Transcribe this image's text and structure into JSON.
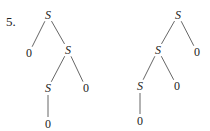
{
  "problem_number": "5.",
  "trees": [
    {
      "name": "left-tree",
      "nodes": [
        {
          "id": "a",
          "label": "S",
          "x": 48,
          "y": 15,
          "italic": true
        },
        {
          "id": "b",
          "label": "0",
          "x": 29,
          "y": 53,
          "italic": false
        },
        {
          "id": "c",
          "label": "S",
          "x": 68,
          "y": 50,
          "italic": true
        },
        {
          "id": "d",
          "label": "S",
          "x": 48,
          "y": 88,
          "italic": true
        },
        {
          "id": "e",
          "label": "0",
          "x": 86,
          "y": 88,
          "italic": false
        },
        {
          "id": "f",
          "label": "0",
          "x": 48,
          "y": 124,
          "italic": false
        }
      ],
      "edges": [
        [
          "a",
          "b"
        ],
        [
          "a",
          "c"
        ],
        [
          "c",
          "d"
        ],
        [
          "c",
          "e"
        ],
        [
          "d",
          "f"
        ]
      ]
    },
    {
      "name": "right-tree",
      "nodes": [
        {
          "id": "a",
          "label": "S",
          "x": 178,
          "y": 15,
          "italic": true
        },
        {
          "id": "b",
          "label": "0",
          "x": 197,
          "y": 52,
          "italic": false
        },
        {
          "id": "c",
          "label": "S",
          "x": 158,
          "y": 50,
          "italic": true
        },
        {
          "id": "d",
          "label": "S",
          "x": 140,
          "y": 86,
          "italic": true
        },
        {
          "id": "e",
          "label": "0",
          "x": 177,
          "y": 86,
          "italic": false
        },
        {
          "id": "f",
          "label": "0",
          "x": 140,
          "y": 121,
          "italic": false
        }
      ],
      "edges": [
        [
          "a",
          "b"
        ],
        [
          "a",
          "c"
        ],
        [
          "c",
          "d"
        ],
        [
          "c",
          "e"
        ],
        [
          "d",
          "f"
        ]
      ]
    }
  ]
}
